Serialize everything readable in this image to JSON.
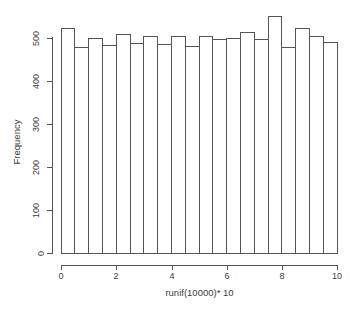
{
  "chart_data": {
    "type": "bar",
    "title": "",
    "xlabel": "runif(10000)* 10",
    "ylabel": "Frequency",
    "xlim": [
      0,
      10
    ],
    "ylim": [
      0,
      560
    ],
    "grid": false,
    "legend": "none",
    "bin_width": 0.5,
    "bin_edges": [
      0,
      0.5,
      1,
      1.5,
      2,
      2.5,
      3,
      3.5,
      4,
      4.5,
      5,
      5.5,
      6,
      6.5,
      7,
      7.5,
      8,
      8.5,
      9,
      9.5,
      10
    ],
    "categories": [
      "0-0.5",
      "0.5-1",
      "1-1.5",
      "1.5-2",
      "2-2.5",
      "2.5-3",
      "3-3.5",
      "3.5-4",
      "4-4.5",
      "4.5-5",
      "5-5.5",
      "5.5-6",
      "6-6.5",
      "6.5-7",
      "7-7.5",
      "7.5-8",
      "8-8.5",
      "8.5-9",
      "9-9.5",
      "9.5-10"
    ],
    "values": [
      523,
      478,
      500,
      483,
      508,
      487,
      503,
      486,
      503,
      481,
      503,
      496,
      499,
      512,
      497,
      551,
      478,
      522,
      504,
      490
    ],
    "x_ticks": [
      0,
      2,
      4,
      6,
      8,
      10
    ],
    "x_tick_labels": [
      "0",
      "2",
      "4",
      "6",
      "8",
      "10"
    ],
    "y_ticks": [
      0,
      100,
      200,
      300,
      400,
      500
    ],
    "y_tick_labels": [
      "0",
      "100",
      "200",
      "300",
      "400",
      "500"
    ],
    "bar_fill": "#ffffff",
    "bar_stroke": "#555555",
    "axis_color": "#555555",
    "text_color": "#3c3c3c",
    "background": "#ffffff"
  },
  "axes": {
    "y_title": "Frequency",
    "x_title": "runif(10000)* 10"
  },
  "y_tick_labels": [
    "0",
    "100",
    "200",
    "300",
    "400",
    "500"
  ],
  "x_tick_labels": [
    "0",
    "2",
    "4",
    "6",
    "8",
    "10"
  ]
}
